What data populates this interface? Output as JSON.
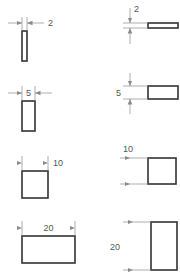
{
  "drawing": {
    "title": "Rectangle size dimension reference",
    "units_note": "",
    "stroke_color": "#333333",
    "dimension_line_color": "#8a8a8a",
    "text_color": "#555555",
    "fill_color": "#ffffff",
    "background_color": "#ffffff",
    "columns": [
      {
        "id": "left",
        "measure": "width",
        "dimension_orientation": "horizontal"
      },
      {
        "id": "right",
        "measure": "height",
        "dimension_orientation": "vertical"
      }
    ],
    "rows": [
      {
        "value": "2",
        "left": {
          "shape_name": "rectangle-width-2",
          "dimension_label": "2",
          "label_position": "right-of-arrows",
          "arrow_direction": "inward",
          "rect": {
            "x": 22,
            "y": 31,
            "w": 5,
            "h": 30
          },
          "ext_lines": {
            "x1": 22,
            "x2": 27,
            "y_top": 17,
            "y_bottom": 31
          },
          "dim_line_y": 23,
          "dim_tail_left_x": 8,
          "dim_tail_right_x": 44,
          "label_x": 48,
          "label_y": 26
        },
        "right": {
          "shape_name": "rectangle-height-2",
          "dimension_label": "2",
          "label_position": "above-dimension-line",
          "arrow_direction": "inward",
          "rect": {
            "x": 148,
            "y": 23,
            "w": 30,
            "h": 5
          },
          "ext_lines": {
            "y1": 23,
            "y2": 28,
            "x_left": 123,
            "x_right": 148
          },
          "dim_line_x": 130,
          "dim_tail_top_y": 8,
          "dim_tail_bottom_y": 44,
          "label_x": 134,
          "label_y": 12
        }
      },
      {
        "value": "5",
        "left": {
          "shape_name": "rectangle-width-5",
          "dimension_label": "5",
          "label_position": "between-arrows",
          "arrow_direction": "inward",
          "rect": {
            "x": 22,
            "y": 101,
            "w": 13,
            "h": 30
          },
          "ext_lines": {
            "x1": 22,
            "x2": 35,
            "y_top": 86,
            "y_bottom": 101
          },
          "dim_line_y": 93,
          "dim_tail_left_x": 8,
          "dim_tail_right_x": 52,
          "label_x": 25,
          "label_y": 96
        },
        "right": {
          "shape_name": "rectangle-height-5",
          "dimension_label": "5",
          "label_position": "left-of-dimension-line",
          "arrow_direction": "inward",
          "rect": {
            "x": 148,
            "y": 86,
            "w": 30,
            "h": 13
          },
          "ext_lines": {
            "y1": 86,
            "y2": 99,
            "x_left": 123,
            "x_right": 148
          },
          "dim_line_x": 130,
          "dim_tail_top_y": 73,
          "dim_tail_bottom_y": 114,
          "label_x": 121,
          "label_y": 96
        }
      },
      {
        "value": "10",
        "left": {
          "shape_name": "rectangle-width-10",
          "dimension_label": "10",
          "label_position": "right-of-arrows",
          "arrow_direction": "inward",
          "rect": {
            "x": 22,
            "y": 171,
            "w": 26,
            "h": 27
          },
          "ext_lines": {
            "x1": 22,
            "x2": 48,
            "y_top": 156,
            "y_bottom": 171
          },
          "dim_line_y": 163,
          "dim_tail_left_x": 22,
          "dim_tail_right_x": 48,
          "label_x": 53,
          "label_y": 166
        },
        "right": {
          "shape_name": "rectangle-height-10",
          "dimension_label": "10",
          "label_position": "above-dimension-line",
          "arrow_direction": "inward",
          "rect": {
            "x": 148,
            "y": 158,
            "w": 28,
            "h": 26
          },
          "ext_lines": {
            "y1": 158,
            "y2": 184,
            "x_left": 120,
            "x_right": 148
          },
          "dim_line_x": 130,
          "dim_tail_top_y": 158,
          "dim_tail_bottom_y": 184,
          "label_x": 123,
          "label_y": 152
        }
      },
      {
        "value": "20",
        "left": {
          "shape_name": "rectangle-width-20",
          "dimension_label": "20",
          "label_position": "between-arrows",
          "arrow_direction": "inward",
          "rect": {
            "x": 22,
            "y": 236,
            "w": 53,
            "h": 27
          },
          "ext_lines": {
            "x1": 22,
            "x2": 75,
            "y_top": 221,
            "y_bottom": 236
          },
          "dim_line_y": 228,
          "dim_tail_left_x": 22,
          "dim_tail_right_x": 75,
          "label_x": 40,
          "label_y": 231
        },
        "right": {
          "shape_name": "rectangle-height-20",
          "dimension_label": "20",
          "label_position": "left-of-dimension-line",
          "arrow_direction": "inward",
          "rect": {
            "x": 151,
            "y": 222,
            "w": 26,
            "h": 48
          },
          "ext_lines": {
            "y1": 222,
            "y2": 270,
            "x_left": 123,
            "x_right": 151
          },
          "dim_line_x": 133,
          "dim_tail_top_y": 222,
          "dim_tail_bottom_y": 270,
          "label_x": 120,
          "label_y": 250
        }
      }
    ]
  }
}
